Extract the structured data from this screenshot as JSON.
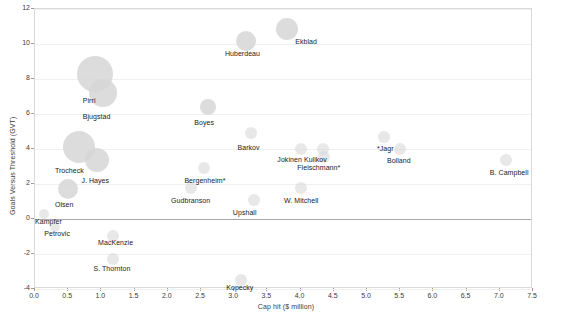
{
  "chart_data": {
    "type": "scatter",
    "title": "",
    "xlabel": "Cap hit ($ million)",
    "ylabel": "Goals Versus Threshold (GVT)",
    "xlim": [
      0.0,
      7.5
    ],
    "ylim": [
      -4,
      12
    ],
    "xticks": [
      "0.0",
      "0.5",
      "1.0",
      "1.5",
      "2.0",
      "2.5",
      "3.0",
      "3.5",
      "4.0",
      "4.5",
      "5.0",
      "5.5",
      "6.0",
      "6.5",
      "7.0",
      "7.5"
    ],
    "xtick_values": [
      0.0,
      0.5,
      1.0,
      1.5,
      2.0,
      2.5,
      3.0,
      3.5,
      4.0,
      4.5,
      5.0,
      5.5,
      6.0,
      6.5,
      7.0,
      7.5
    ],
    "yticks": [
      "12",
      "10",
      "8",
      "6",
      "4",
      "2",
      "0",
      "-2",
      "-4"
    ],
    "ytick_values": [
      12,
      10,
      8,
      6,
      4,
      2,
      0,
      -2,
      -4
    ],
    "grid": true,
    "legend": "none",
    "bubble_color": "#d6d6d6",
    "zero_line_color": "#a8a8a8",
    "points": [
      {
        "label": "Ekblad",
        "x": 3.8,
        "y": 10.85,
        "size": 11,
        "lx": 3.92,
        "ly": 10.05
      },
      {
        "label": "Huberdeau",
        "x": 3.18,
        "y": 10.15,
        "size": 10,
        "lx": 2.86,
        "ly": 9.35
      },
      {
        "label": "Pirri",
        "x": 0.9,
        "y": 8.3,
        "size": 18,
        "lx": 0.72,
        "ly": 6.7
      },
      {
        "label": "Bjugstad",
        "x": 1.02,
        "y": 7.2,
        "size": 14,
        "lx": 0.72,
        "ly": 5.75
      },
      {
        "label": "Boyes",
        "x": 2.6,
        "y": 6.4,
        "size": 8,
        "lx": 2.4,
        "ly": 5.45
      },
      {
        "label": "Barkov",
        "x": 3.25,
        "y": 4.9,
        "size": 6,
        "lx": 3.05,
        "ly": 4.0
      },
      {
        "label": "*Jagr",
        "x": 5.25,
        "y": 4.7,
        "size": 6,
        "lx": 5.15,
        "ly": 3.95
      },
      {
        "label": "Trocheck",
        "x": 0.66,
        "y": 4.1,
        "size": 16,
        "lx": 0.3,
        "ly": 2.7
      },
      {
        "label": "J. Hayes",
        "x": 0.93,
        "y": 3.4,
        "size": 12,
        "lx": 0.7,
        "ly": 2.1
      },
      {
        "label": "Jokinen",
        "x": 4.0,
        "y": 4.0,
        "size": 6,
        "lx": 3.65,
        "ly": 3.3
      },
      {
        "label": "Kulikov",
        "x": 4.33,
        "y": 4.0,
        "size": 6,
        "lx": 4.05,
        "ly": 3.3
      },
      {
        "label": "Bolland",
        "x": 5.5,
        "y": 4.0,
        "size": 6,
        "lx": 5.3,
        "ly": 3.25
      },
      {
        "label": "Fleischmann*",
        "x": 4.35,
        "y": 3.55,
        "size": 6,
        "lx": 3.95,
        "ly": 2.85
      },
      {
        "label": "B. Campbell",
        "x": 7.1,
        "y": 3.4,
        "size": 6,
        "lx": 6.85,
        "ly": 2.6
      },
      {
        "label": "Bergenheim*",
        "x": 2.55,
        "y": 2.9,
        "size": 6,
        "lx": 2.25,
        "ly": 2.1
      },
      {
        "label": "Gudbranson",
        "x": 2.35,
        "y": 1.8,
        "size": 6,
        "lx": 2.05,
        "ly": 0.95
      },
      {
        "label": "W. Mitchell",
        "x": 4.0,
        "y": 1.8,
        "size": 6,
        "lx": 3.75,
        "ly": 1.0
      },
      {
        "label": "Olsen",
        "x": 0.5,
        "y": 1.7,
        "size": 10,
        "lx": 0.3,
        "ly": 0.75
      },
      {
        "label": "Upshall",
        "x": 3.3,
        "y": 1.1,
        "size": 6,
        "lx": 2.98,
        "ly": 0.3
      },
      {
        "label": "Kampfer",
        "x": 0.14,
        "y": 0.3,
        "size": 5,
        "lx": 0.0,
        "ly": -0.2
      },
      {
        "label": "Petrovic",
        "x": 0.3,
        "y": -0.45,
        "size": 5,
        "lx": 0.14,
        "ly": -0.9
      },
      {
        "label": "MacKenzie",
        "x": 1.18,
        "y": -0.95,
        "size": 6,
        "lx": 0.95,
        "ly": -1.45
      },
      {
        "label": "S. Thornton",
        "x": 1.18,
        "y": -2.3,
        "size": 6,
        "lx": 0.88,
        "ly": -2.9
      },
      {
        "label": "Kopecky",
        "x": 3.1,
        "y": -3.5,
        "size": 6,
        "lx": 2.88,
        "ly": -4.0
      }
    ]
  }
}
